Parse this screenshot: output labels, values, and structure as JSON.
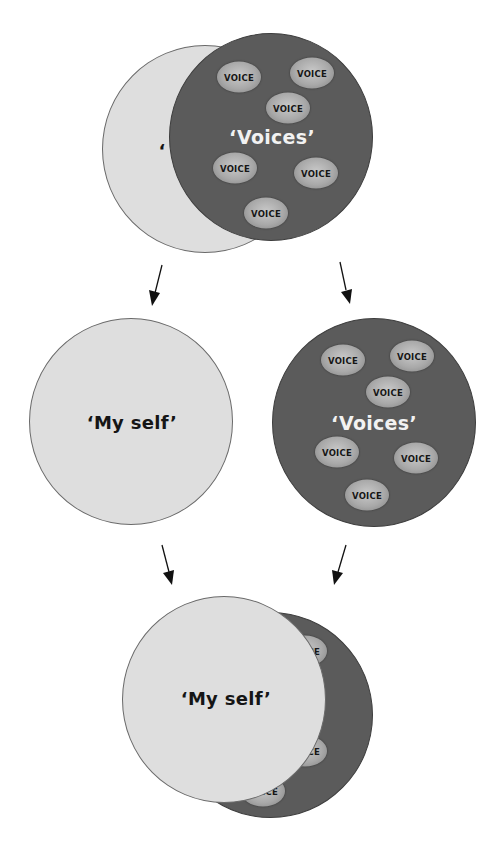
{
  "labels": {
    "self": "‘My self’",
    "voices": "‘Voices’",
    "voice": "VOICE",
    "self_fragment": "‘",
    "voice_fragment_ice": "ICE",
    "voice_fragment_ce": "CE"
  },
  "colors": {
    "self_fill": "#dedede",
    "voices_fill": "#5b5b5b",
    "voice_bubble": "#a9a9a9",
    "arrow": "#111111"
  },
  "stages": [
    {
      "name": "merged",
      "description": "Voices circle overlapping and dominating My self circle"
    },
    {
      "name": "separated",
      "description": "My self and Voices as separate circles"
    },
    {
      "name": "reintegrated",
      "description": "My self circle in front, overlapping Voices circle"
    }
  ]
}
